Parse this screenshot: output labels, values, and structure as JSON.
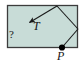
{
  "figure": {
    "type": "ray-diagram",
    "labels": {
      "ray_label": "T",
      "unknown_label": "?",
      "point_label": "P"
    },
    "colors": {
      "fill": "#c8dcd7",
      "outline": "#3c3c3c",
      "ray": "#1a1a1a",
      "point": "#000000",
      "background": "#ffffff"
    },
    "geometry": {
      "rect": {
        "x": 7,
        "y": 5,
        "width": 71,
        "height": 43
      },
      "point_P": {
        "x": 62,
        "y": 48
      },
      "vertex_right": {
        "x": 78,
        "y": 29
      },
      "apex_top": {
        "x": 57,
        "y": 6
      },
      "arrow_tip": {
        "x": 27,
        "y": 24
      },
      "segments": [
        {
          "from": "point_P",
          "to": "vertex_right"
        },
        {
          "from": "vertex_right",
          "to": "apex_top"
        },
        {
          "from": "apex_top",
          "to": "arrow_tip",
          "arrowhead": true
        }
      ]
    }
  }
}
